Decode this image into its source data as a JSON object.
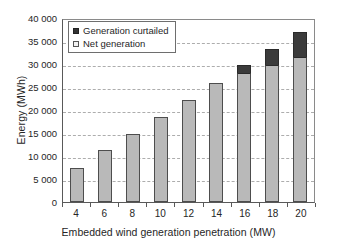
{
  "chart_data": {
    "type": "bar",
    "stacked": true,
    "title": "",
    "xlabel": "Embedded wind generation penetration (MW)",
    "ylabel": "Energy (MWh)",
    "categories": [
      "4",
      "6",
      "8",
      "10",
      "12",
      "14",
      "16",
      "18",
      "20"
    ],
    "series": [
      {
        "name": "Net generation",
        "color": "#b9b9b9",
        "values": [
          7400,
          11200,
          14800,
          18500,
          22200,
          25800,
          28000,
          29700,
          31500
        ]
      },
      {
        "name": "Generation curtailed",
        "color": "#3b3b3b",
        "values": [
          0,
          0,
          0,
          0,
          0,
          0,
          1700,
          3600,
          5500
        ]
      }
    ],
    "totals": [
      7400,
      11200,
      14800,
      18500,
      22200,
      25800,
      29700,
      33300,
      37000
    ],
    "ylim": [
      0,
      40000
    ],
    "ytick_values": [
      40000,
      35000,
      30000,
      25000,
      20000,
      15000,
      10000,
      5000,
      0
    ],
    "ytick_labels": [
      "40 000",
      "35 000",
      "30 000",
      "25 000",
      "20 000",
      "15 000",
      "10 000",
      "5 000",
      "0"
    ],
    "grid": true,
    "grid_axis": "y",
    "grid_style": "dashed",
    "legend_position": "top-left",
    "legend": [
      {
        "label": "Generation curtailed",
        "swatch": "dark"
      },
      {
        "label": "Net generation",
        "swatch": "light"
      }
    ]
  }
}
